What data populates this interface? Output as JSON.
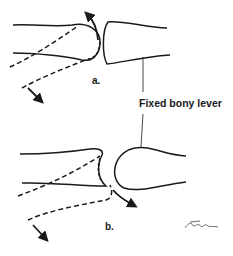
{
  "figure": {
    "panel_a": {
      "label": "a."
    },
    "panel_b": {
      "label": "b."
    },
    "callout": {
      "label": "Fixed bony lever"
    },
    "signature": "signature",
    "colors": {
      "ink": "#1a1a1a",
      "background": "#ffffff"
    }
  }
}
